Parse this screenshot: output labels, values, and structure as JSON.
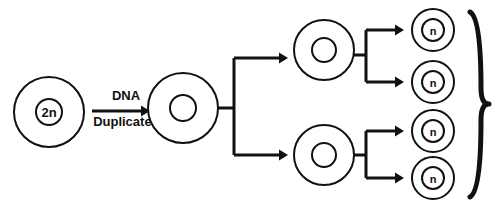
{
  "diagram": {
    "background_color": "#ffffff",
    "stroke_color": "#111111",
    "fill_color": "#ffffff",
    "cells": {
      "parent": {
        "label": "2n",
        "label_size": 13,
        "cx": 49,
        "cy": 112,
        "r_outer": 35,
        "r_inner": 13,
        "stroke_width": 2
      },
      "duplicated": {
        "label": "",
        "label_size": 13,
        "cx": 183,
        "cy": 108,
        "r_outer": 35,
        "r_inner": 13,
        "stroke_width": 2
      },
      "daughters": [
        {
          "label": "",
          "label_size": 12,
          "cx": 324,
          "cy": 50,
          "r_outer": 30,
          "r_inner": 12,
          "stroke_width": 2
        },
        {
          "label": "",
          "label_size": 12,
          "cx": 324,
          "cy": 155,
          "r_outer": 30,
          "r_inner": 12,
          "stroke_width": 2
        }
      ],
      "gametes": [
        {
          "label": "n",
          "label_size": 11,
          "cx": 433,
          "cy": 30,
          "r_outer": 21,
          "r_inner": 11,
          "stroke_width": 2
        },
        {
          "label": "n",
          "label_size": 11,
          "cx": 433,
          "cy": 82,
          "r_outer": 21,
          "r_inner": 11,
          "stroke_width": 2
        },
        {
          "label": "n",
          "label_size": 11,
          "cx": 433,
          "cy": 131,
          "r_outer": 21,
          "r_inner": 11,
          "stroke_width": 2
        },
        {
          "label": "n",
          "label_size": 11,
          "cx": 433,
          "cy": 178,
          "r_outer": 21,
          "r_inner": 11,
          "stroke_width": 2
        }
      ]
    },
    "step_labels": {
      "dna_duplicates_line1": "DNA",
      "dna_duplicates_line2": "Duplicates",
      "font_size": 13,
      "x": 126,
      "y_line1": 100,
      "y_line2": 126
    },
    "arrows": {
      "duplication": {
        "x1": 92,
        "x2": 150,
        "y": 111,
        "stroke_width": 3,
        "head_size": 9
      },
      "first_division_top": {
        "x1": 262,
        "x2": 288,
        "y": 58,
        "stroke_width": 3,
        "head_size": 9
      },
      "first_division_bottom": {
        "x1": 262,
        "x2": 288,
        "y": 155,
        "stroke_width": 3,
        "head_size": 9
      },
      "second_division": [
        {
          "x1": 380,
          "x2": 404,
          "y": 30,
          "stroke_width": 3,
          "head_size": 9
        },
        {
          "x1": 380,
          "x2": 404,
          "y": 82,
          "stroke_width": 3,
          "head_size": 9
        },
        {
          "x1": 380,
          "x2": 404,
          "y": 131,
          "stroke_width": 3,
          "head_size": 9
        },
        {
          "x1": 380,
          "x2": 404,
          "y": 178,
          "stroke_width": 3,
          "head_size": 9
        }
      ]
    },
    "connectors": {
      "first_split": {
        "stem_x1": 218,
        "stem_x2": 234,
        "stem_y": 108,
        "spine_x": 234,
        "spine_y1": 58,
        "spine_y2": 155,
        "branch_top_y": 58,
        "branch_bottom_y": 155,
        "branch_x2": 262,
        "stroke_width": 3
      },
      "second_split_top": {
        "stem_x1": 354,
        "stem_x2": 366,
        "stem_y": 55,
        "spine_x": 366,
        "spine_y1": 30,
        "spine_y2": 82,
        "branch_x2": 380,
        "stroke_width": 3
      },
      "second_split_bottom": {
        "stem_x1": 354,
        "stem_x2": 366,
        "stem_y": 155,
        "spine_x": 366,
        "spine_y1": 131,
        "spine_y2": 178,
        "branch_x2": 380,
        "stroke_width": 3
      }
    },
    "brace": {
      "shape": "right-curly-brace",
      "x_tip": 489,
      "x_body": 470,
      "y_top": 12,
      "y_bottom": 197,
      "y_mid": 104,
      "stroke_width": 5
    }
  }
}
